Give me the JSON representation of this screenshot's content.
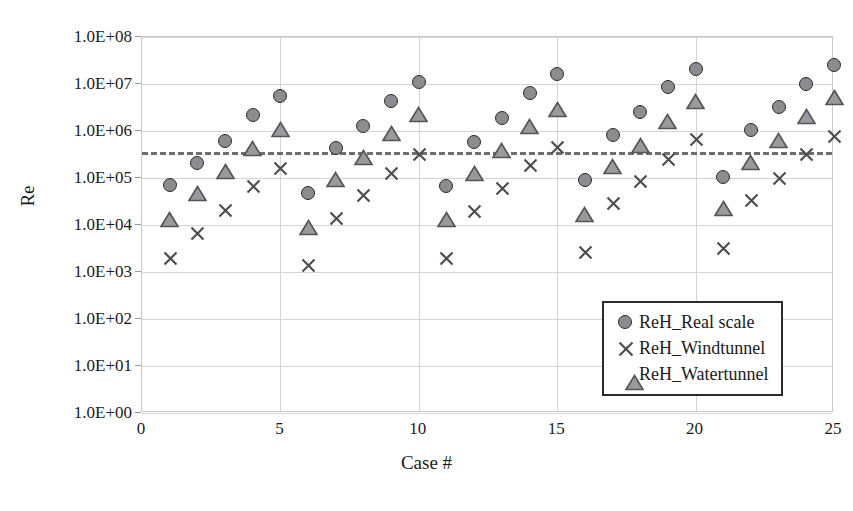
{
  "chart_data": {
    "type": "scatter",
    "title": "",
    "xlabel": "Case #",
    "ylabel": "Re",
    "xlim": [
      0,
      25
    ],
    "ylim": [
      1,
      100000000
    ],
    "yscale": "log",
    "grid": true,
    "legend_position": "bottom-right",
    "x_ticks": [
      "0",
      "5",
      "10",
      "15",
      "20",
      "25"
    ],
    "x_tick_values": [
      0,
      5,
      10,
      15,
      20,
      25
    ],
    "y_ticks": [
      "1.0E+00",
      "1.0E+01",
      "1.0E+02",
      "1.0E+03",
      "1.0E+04",
      "1.0E+05",
      "1.0E+06",
      "1.0E+07",
      "1.0E+08"
    ],
    "y_tick_values": [
      1,
      10,
      100,
      1000,
      10000,
      100000,
      1000000,
      10000000,
      100000000
    ],
    "categories": [
      1,
      2,
      3,
      4,
      5,
      6,
      7,
      8,
      9,
      10,
      11,
      12,
      13,
      14,
      15,
      16,
      17,
      18,
      19,
      20,
      21,
      22,
      23,
      24,
      25
    ],
    "series": [
      {
        "name": "ReH_Real scale",
        "marker": "circle",
        "color": "#8c8c90",
        "edge_color": "#2b2b2b",
        "values": [
          70000,
          210000,
          620000,
          2200000,
          5500000,
          47000,
          440000,
          1250000,
          4400000,
          11000000,
          68000,
          580000,
          1900000,
          6300000,
          16000000,
          92000,
          840000,
          2500000,
          8500000,
          21000000,
          105000,
          1050000,
          3200000,
          10000000,
          25000000
        ]
      },
      {
        "name": "ReH_Windtunnel",
        "marker": "cross",
        "color": "#4d4d4f",
        "values": [
          2000,
          6800,
          21000,
          68000,
          165000,
          1400,
          14000,
          43000,
          130000,
          330000,
          1950,
          20000,
          60000,
          190000,
          450000,
          2700,
          29000,
          85000,
          250000,
          680000,
          3200,
          34000,
          98000,
          320000,
          790000
        ]
      },
      {
        "name": "ReH_Watertunnel",
        "marker": "triangle",
        "color": "#9a9a9e",
        "edge_color": "#555558",
        "values": [
          13000,
          46000,
          140000,
          420000,
          1100000,
          9000,
          95000,
          270000,
          870000,
          2200000,
          13000,
          125000,
          390000,
          1250000,
          2800000,
          17000,
          175000,
          500000,
          1600000,
          4300000,
          22000,
          210000,
          640000,
          2050000,
          5200000
        ]
      }
    ],
    "threshold_line": {
      "name": "critical-Re-threshold",
      "value": 350000,
      "style": "dashed",
      "color": "#6e6e72"
    }
  },
  "legend": {
    "items": [
      {
        "label": "ReH_Real scale",
        "marker": "circle"
      },
      {
        "label": "ReH_Windtunnel",
        "marker": "cross"
      },
      {
        "label": "ReH_Watertunnel",
        "marker": "triangle"
      }
    ]
  }
}
